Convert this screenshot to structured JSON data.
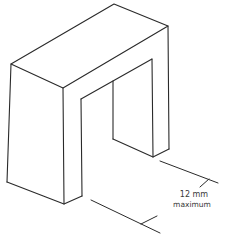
{
  "figure": {
    "type": "isometric line drawing",
    "stroke_color": "#2a2a2a",
    "background": "#ffffff"
  },
  "dimension": {
    "value": "12 mm",
    "qualifier": "maximum"
  }
}
